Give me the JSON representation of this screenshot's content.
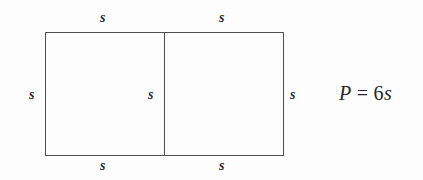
{
  "figure": {
    "kind": "geometry-diagram",
    "colors": {
      "background": "#fdfdfd",
      "stroke": "#4f4f52",
      "text": "#2a2a2c",
      "equation_text": "#26262a"
    },
    "rectangle": {
      "x": 45,
      "y": 32,
      "width": 239,
      "height": 124,
      "divider_x": 164
    },
    "labels": {
      "top_left": "s",
      "top_right": "s",
      "left": "s",
      "middle": "s",
      "right": "s",
      "bottom_left": "s",
      "bottom_right": "s"
    },
    "equation": {
      "lhs": "P",
      "operator": "=",
      "coefficient": "6",
      "variable": "s",
      "full": "P = 6s"
    }
  }
}
